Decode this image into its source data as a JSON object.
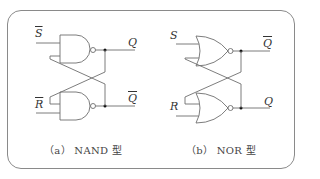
{
  "figure": {
    "panels": [
      {
        "id": "a",
        "caption": "（a） NAND 型",
        "gate_type": "NAND",
        "inputs": [
          {
            "label": "S",
            "overline": true
          },
          {
            "label": "R",
            "overline": true
          }
        ],
        "outputs": [
          {
            "label": "Q",
            "overline": false
          },
          {
            "label": "Q",
            "overline": true
          }
        ]
      },
      {
        "id": "b",
        "caption": "（b） NOR 型",
        "gate_type": "NOR",
        "inputs": [
          {
            "label": "S",
            "overline": false
          },
          {
            "label": "R",
            "overline": false
          }
        ],
        "outputs": [
          {
            "label": "Q",
            "overline": true
          },
          {
            "label": "Q",
            "overline": false
          }
        ]
      }
    ],
    "colors": {
      "line": "#6e6e6e",
      "frame": "#8a8a8a",
      "dot": "#111111"
    }
  }
}
